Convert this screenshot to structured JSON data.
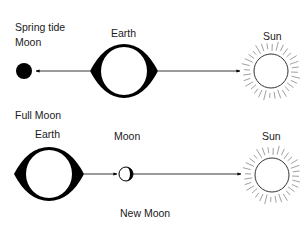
{
  "diagram": {
    "title": "Spring tide",
    "panels": [
      {
        "id": "full-moon",
        "caption": "Full Moon",
        "labels": {
          "moon": "Moon",
          "earth": "Earth",
          "sun": "Sun"
        },
        "order_left_to_right": [
          "Moon",
          "Earth",
          "Sun"
        ],
        "moon_fill": "#000000"
      },
      {
        "id": "new-moon",
        "caption": "New Moon",
        "labels": {
          "earth": "Earth",
          "moon": "Moon",
          "sun": "Sun"
        },
        "order_left_to_right": [
          "Earth",
          "Moon",
          "Sun"
        ],
        "moon_fill": "#ffffff"
      }
    ],
    "colors": {
      "ink": "#000000",
      "background": "#ffffff",
      "sun_stroke": "#333333",
      "ray_stroke": "#888888"
    }
  }
}
